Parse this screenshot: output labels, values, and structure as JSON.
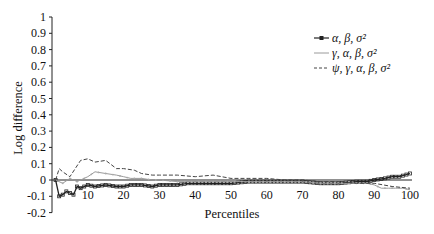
{
  "chart_data": {
    "type": "line",
    "title": "",
    "xlabel": "Percentiles",
    "ylabel": "Log difference",
    "xlim": [
      0,
      100
    ],
    "ylim": [
      -0.2,
      1
    ],
    "xticks": [
      10,
      20,
      30,
      40,
      50,
      60,
      70,
      80,
      90,
      100
    ],
    "yticks": [
      1,
      0.9,
      0.8,
      0.7,
      0.6,
      0.5,
      0.4,
      0.3,
      0.2,
      0.1,
      0,
      -0.1,
      -0.2
    ],
    "ytick_labels": [
      "1",
      "0.9",
      "0.8",
      "0.7",
      "0.6",
      "0.5",
      "0.4",
      "0.3",
      "0.2",
      "0.1",
      "0",
      "-0.1",
      "-0.2"
    ],
    "grid": false,
    "zero_line": true,
    "legend_position": "upper right",
    "series": [
      {
        "name": "α, β, σ²",
        "style": "solid-square-markers",
        "color": "#222222",
        "x": [
          1,
          2,
          3,
          4,
          5,
          6,
          7,
          8,
          10,
          12,
          15,
          18,
          20,
          22,
          25,
          28,
          30,
          33,
          35,
          38,
          40,
          45,
          50,
          55,
          60,
          65,
          70,
          75,
          80,
          85,
          88,
          90,
          93,
          95,
          97,
          100
        ],
        "values": [
          0.0,
          -0.1,
          -0.09,
          -0.07,
          -0.08,
          -0.09,
          -0.04,
          -0.05,
          -0.03,
          -0.04,
          -0.03,
          -0.04,
          -0.04,
          -0.03,
          -0.03,
          -0.04,
          -0.03,
          -0.03,
          -0.03,
          -0.02,
          -0.02,
          -0.02,
          -0.02,
          -0.01,
          -0.01,
          -0.01,
          -0.01,
          -0.02,
          -0.02,
          -0.01,
          -0.01,
          0.0,
          0.01,
          0.02,
          0.02,
          0.04
        ]
      },
      {
        "name": "γ, α, β, σ²",
        "style": "solid-thin-gray",
        "color": "#9a9a9a",
        "x": [
          1,
          3,
          5,
          7,
          10,
          12,
          15,
          18,
          20,
          22,
          25,
          28,
          30,
          35,
          40,
          45,
          50,
          55,
          60,
          65,
          70,
          75,
          80,
          85,
          88,
          90,
          92,
          94,
          96,
          98,
          100
        ],
        "values": [
          0.0,
          -0.02,
          0.01,
          -0.01,
          0.02,
          0.05,
          0.04,
          0.03,
          0.02,
          0.01,
          0.01,
          0.0,
          0.0,
          -0.01,
          -0.01,
          -0.01,
          -0.01,
          -0.01,
          -0.01,
          -0.01,
          -0.01,
          -0.02,
          -0.02,
          -0.02,
          -0.02,
          -0.03,
          -0.05,
          -0.05,
          -0.05,
          -0.05,
          -0.06
        ]
      },
      {
        "name": "ψ, γ, α, β, σ²",
        "style": "dashed",
        "color": "#444444",
        "x": [
          1,
          2,
          3,
          5,
          8,
          10,
          12,
          15,
          18,
          20,
          23,
          25,
          28,
          30,
          35,
          40,
          45,
          50,
          55,
          60,
          65,
          70,
          75,
          80,
          85,
          90,
          95,
          100
        ],
        "values": [
          0.0,
          0.07,
          0.05,
          0.02,
          0.12,
          0.13,
          0.11,
          0.12,
          0.07,
          0.07,
          0.06,
          0.04,
          0.03,
          0.03,
          0.03,
          0.02,
          0.03,
          0.01,
          0.01,
          0.01,
          0.0,
          0.0,
          -0.01,
          -0.01,
          -0.02,
          -0.02,
          -0.04,
          -0.05
        ]
      }
    ]
  },
  "labels": {
    "xlabel": "Percentiles",
    "ylabel": "Log difference",
    "legend": [
      "α, β, σ²",
      "γ, α, β, σ²",
      "ψ, γ, α, β, σ²"
    ]
  }
}
